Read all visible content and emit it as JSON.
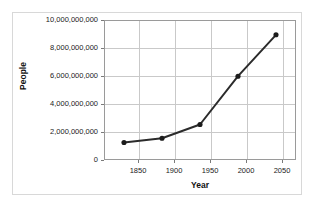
{
  "chart_data": {
    "type": "line",
    "title": "",
    "xlabel": "Year",
    "ylabel": "People",
    "x": [
      1850,
      1900,
      1950,
      2000,
      2050
    ],
    "values": [
      1200000000,
      1500000000,
      2500000000,
      6000000000,
      9000000000
    ],
    "series": [
      {
        "name": "People",
        "values": [
          1200000000,
          1500000000,
          2500000000,
          6000000000,
          9000000000
        ]
      }
    ],
    "xlim": [
      1825,
      2075
    ],
    "ylim": [
      0,
      10000000000
    ],
    "xticks": [
      1850,
      1900,
      1950,
      2000,
      2050
    ],
    "xtick_labels": [
      "1850",
      "1900",
      "1950",
      "2000",
      "2050"
    ],
    "yticks": [
      0,
      2000000000,
      4000000000,
      6000000000,
      8000000000,
      10000000000
    ],
    "ytick_labels": [
      "0",
      "2,000,000,000",
      "4,000,000,000",
      "6,000,000,000",
      "8,000,000,000",
      "10,000,000,000"
    ],
    "grid": true,
    "legend": false,
    "legend_position": "none",
    "colors": {
      "line": "#2b2b2b",
      "marker": "#1c1c1c",
      "grid": "#c9c9c9",
      "axis": "#9a9a9a",
      "frame": "#d8d8d8",
      "text": "#1a1a1a",
      "background": "#ffffff"
    },
    "marker": "circle",
    "line_width": 2
  }
}
